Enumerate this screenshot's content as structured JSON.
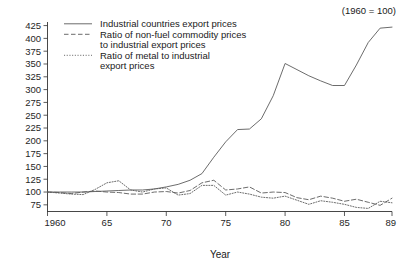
{
  "chart_data": {
    "type": "line",
    "title": "",
    "note": "(1960 = 100)",
    "xlabel": "Year",
    "ylabel": "",
    "grid": false,
    "legend_position": "top-center",
    "xlim": [
      1960,
      1989
    ],
    "ylim": [
      62,
      432
    ],
    "yticks": [
      75,
      100,
      125,
      150,
      175,
      200,
      225,
      250,
      275,
      300,
      325,
      350,
      375,
      400,
      425
    ],
    "ytick_labels": [
      "75",
      "100",
      "125",
      "150",
      "175",
      "200",
      "225",
      "250",
      "275",
      "300",
      "325",
      "350",
      "375",
      "400",
      "425"
    ],
    "xticks": [
      1960,
      1965,
      1970,
      1975,
      1980,
      1985,
      1989
    ],
    "xtick_labels": [
      "1960",
      "65",
      "70",
      "75",
      "80",
      "85",
      "89"
    ],
    "x": [
      1960,
      1961,
      1962,
      1963,
      1964,
      1965,
      1966,
      1967,
      1968,
      1969,
      1970,
      1971,
      1972,
      1973,
      1974,
      1975,
      1976,
      1977,
      1978,
      1979,
      1980,
      1981,
      1982,
      1983,
      1984,
      1985,
      1986,
      1987,
      1988,
      1989
    ],
    "series": [
      {
        "name": "Industrial countries export prices",
        "style": "solid",
        "values": [
          100,
          100,
          100,
          100,
          101,
          102,
          103,
          104,
          104,
          106,
          110,
          115,
          123,
          136,
          168,
          198,
          222,
          223,
          243,
          288,
          351,
          339,
          327,
          317,
          308,
          308,
          348,
          392,
          420,
          422
        ]
      },
      {
        "name": "Ratio of non-fuel commodity prices to industrial export prices",
        "style": "dashed",
        "values": [
          100,
          99,
          97,
          100,
          102,
          100,
          99,
          96,
          96,
          100,
          101,
          98,
          103,
          118,
          123,
          104,
          106,
          110,
          98,
          100,
          99,
          89,
          85,
          92,
          88,
          82,
          86,
          80,
          74,
          88
        ]
      },
      {
        "name": "Ratio of metal to industrial export prices",
        "style": "dotted",
        "values": [
          100,
          98,
          96,
          95,
          105,
          118,
          122,
          104,
          100,
          106,
          108,
          94,
          97,
          113,
          113,
          94,
          100,
          96,
          90,
          88,
          92,
          84,
          76,
          83,
          80,
          76,
          70,
          68,
          82,
          79
        ]
      }
    ],
    "legend": [
      {
        "lines": [
          "Industrial countries export prices"
        ],
        "style": "solid"
      },
      {
        "lines": [
          "Ratio of non-fuel commodity prices",
          "to industrial export prices"
        ],
        "style": "dashed"
      },
      {
        "lines": [
          "Ratio of metal to industrial",
          "export prices"
        ],
        "style": "dotted"
      }
    ],
    "colors": {
      "line": "#5b5b5b",
      "axis": "#333333",
      "text": "#1a1a1a",
      "background": "#ffffff"
    }
  }
}
